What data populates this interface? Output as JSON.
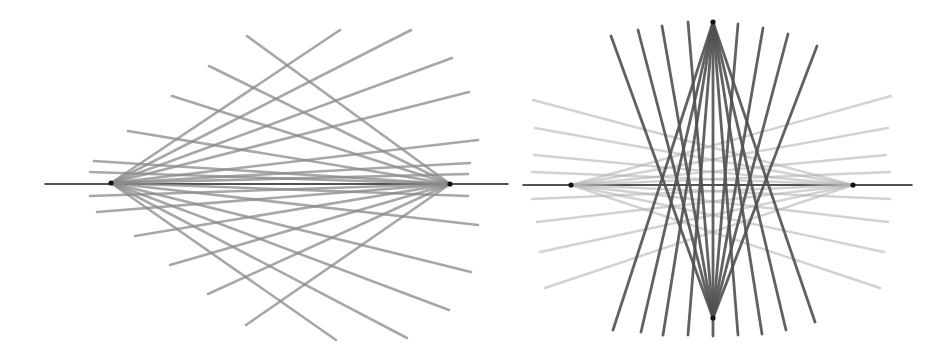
{
  "figure": {
    "title": "",
    "background_color": "#ffffff",
    "width": 948,
    "height": 352,
    "panel_count": 2,
    "panels": [
      {
        "name": "left-panel",
        "label": "",
        "axis": {
          "x1": 45,
          "y1": 184,
          "x2": 508,
          "y2": 184,
          "color": "#1c1c1c",
          "width": 1.6
        },
        "foci": [
          {
            "name": "left-focus",
            "x": 111,
            "y": 183
          },
          {
            "name": "right-focus",
            "x": 450,
            "y": 184
          }
        ]
      },
      {
        "name": "right-panel",
        "label": "",
        "axis": {
          "x1": 523,
          "y1": 185,
          "x2": 912,
          "y2": 185,
          "color": "#1c1c1c",
          "width": 1.6
        },
        "foci": [
          {
            "name": "left-focus",
            "x": 571,
            "y": 185
          },
          {
            "name": "right-focus",
            "x": 853,
            "y": 185
          },
          {
            "name": "top-vertex",
            "x": 713,
            "y": 22
          },
          {
            "name": "bottom-vertex",
            "x": 713,
            "y": 318
          }
        ]
      }
    ]
  },
  "chart_data": {
    "type": "line",
    "title": "",
    "subtitle": "",
    "xlabel": "",
    "ylabel": "",
    "xlim": [
      0,
      948
    ],
    "ylim": [
      352,
      0
    ],
    "grid": false,
    "legend": "none",
    "annotations": [],
    "series": [
      {
        "name": "left-panel-axis",
        "color": "#1c1c1c",
        "width": 1.6,
        "opacity": 1.0,
        "points": [
          [
            45,
            184
          ],
          [
            508,
            184
          ]
        ]
      },
      {
        "name": "left-panel-pencil-from-left-focus",
        "color": "#8a8a8a",
        "width": 2.6,
        "opacity": 0.75,
        "origin": [
          111,
          183
        ],
        "segments": [
          [
            [
              111,
              183
            ],
            [
              469,
              92
            ]
          ],
          [
            [
              111,
              183
            ],
            [
              452,
              58
            ]
          ],
          [
            [
              111,
              183
            ],
            [
              411,
              30
            ]
          ],
          [
            [
              111,
              183
            ],
            [
              340,
              30
            ]
          ],
          [
            [
              111,
              183
            ],
            [
              478,
              140
            ]
          ],
          [
            [
              111,
              183
            ],
            [
              470,
              163
            ]
          ],
          [
            [
              111,
              183
            ],
            [
              468,
              174
            ]
          ],
          [
            [
              111,
              183
            ],
            [
              468,
              196
            ]
          ],
          [
            [
              111,
              183
            ],
            [
              478,
              225
            ]
          ],
          [
            [
              111,
              183
            ],
            [
              471,
              272
            ]
          ],
          [
            [
              111,
              183
            ],
            [
              449,
              310
            ]
          ],
          [
            [
              111,
              183
            ],
            [
              407,
              338
            ]
          ],
          [
            [
              111,
              183
            ],
            [
              336,
              340
            ]
          ]
        ]
      },
      {
        "name": "left-panel-pencil-from-right-focus",
        "color": "#8a8a8a",
        "width": 2.6,
        "opacity": 0.75,
        "origin": [
          450,
          184
        ],
        "segments": [
          [
            [
              450,
              184
            ],
            [
              247,
              36
            ]
          ],
          [
            [
              450,
              184
            ],
            [
              209,
              66
            ]
          ],
          [
            [
              450,
              184
            ],
            [
              172,
              96
            ]
          ],
          [
            [
              450,
              184
            ],
            [
              128,
              131
            ]
          ],
          [
            [
              450,
              184
            ],
            [
              94,
              161
            ]
          ],
          [
            [
              450,
              184
            ],
            [
              90,
              172
            ]
          ],
          [
            [
              450,
              184
            ],
            [
              90,
              196
            ]
          ],
          [
            [
              450,
              184
            ],
            [
              97,
              212
            ]
          ],
          [
            [
              450,
              184
            ],
            [
              135,
              236
            ]
          ],
          [
            [
              450,
              184
            ],
            [
              170,
              265
            ]
          ],
          [
            [
              450,
              184
            ],
            [
              208,
              294
            ]
          ],
          [
            [
              450,
              184
            ],
            [
              246,
              325
            ]
          ]
        ]
      },
      {
        "name": "right-panel-axis",
        "color": "#1c1c1c",
        "width": 1.6,
        "opacity": 1.0,
        "points": [
          [
            523,
            185
          ],
          [
            912,
            185
          ]
        ]
      },
      {
        "name": "right-panel-pencil-from-left-focus",
        "color": "#b4b4b4",
        "width": 2.4,
        "opacity": 0.6,
        "origin": [
          571,
          185
        ],
        "segments": [
          [
            [
              571,
              185
            ],
            [
              891,
              96
            ]
          ],
          [
            [
              571,
              185
            ],
            [
              888,
              128
            ]
          ],
          [
            [
              571,
              185
            ],
            [
              886,
              155
            ]
          ],
          [
            [
              571,
              185
            ],
            [
              890,
              172
            ]
          ],
          [
            [
              571,
              185
            ],
            [
              890,
              199
            ]
          ],
          [
            [
              571,
              185
            ],
            [
              888,
              222
            ]
          ],
          [
            [
              571,
              185
            ],
            [
              884,
              252
            ]
          ],
          [
            [
              571,
              185
            ],
            [
              880,
              288
            ]
          ]
        ]
      },
      {
        "name": "right-panel-pencil-from-right-focus",
        "color": "#b4b4b4",
        "width": 2.4,
        "opacity": 0.6,
        "origin": [
          853,
          185
        ],
        "segments": [
          [
            [
              853,
              185
            ],
            [
              533,
              100
            ]
          ],
          [
            [
              853,
              185
            ],
            [
              535,
              128
            ]
          ],
          [
            [
              853,
              185
            ],
            [
              534,
              155
            ]
          ],
          [
            [
              853,
              185
            ],
            [
              532,
              172
            ]
          ],
          [
            [
              853,
              185
            ],
            [
              532,
              199
            ]
          ],
          [
            [
              853,
              185
            ],
            [
              537,
              222
            ]
          ],
          [
            [
              853,
              185
            ],
            [
              540,
              252
            ]
          ],
          [
            [
              853,
              185
            ],
            [
              545,
              288
            ]
          ]
        ]
      },
      {
        "name": "right-panel-pencil-from-top-vertex",
        "color": "#505050",
        "width": 2.8,
        "opacity": 0.9,
        "origin": [
          713,
          22
        ],
        "segments": [
          [
            [
              713,
              22
            ],
            [
              613,
              330
            ]
          ],
          [
            [
              713,
              22
            ],
            [
              641,
              332
            ]
          ],
          [
            [
              713,
              22
            ],
            [
              663,
              335
            ]
          ],
          [
            [
              713,
              22
            ],
            [
              688,
              335
            ]
          ],
          [
            [
              713,
              22
            ],
            [
              713,
              336
            ]
          ],
          [
            [
              713,
              22
            ],
            [
              738,
              335
            ]
          ],
          [
            [
              713,
              22
            ],
            [
              762,
              334
            ]
          ],
          [
            [
              713,
              22
            ],
            [
              786,
              330
            ]
          ],
          [
            [
              713,
              22
            ],
            [
              815,
              322
            ]
          ]
        ]
      },
      {
        "name": "right-panel-pencil-from-bottom-vertex",
        "color": "#505050",
        "width": 2.8,
        "opacity": 0.9,
        "origin": [
          713,
          318
        ],
        "segments": [
          [
            [
              713,
              318
            ],
            [
              611,
              36
            ]
          ],
          [
            [
              713,
              318
            ],
            [
              638,
              30
            ]
          ],
          [
            [
              713,
              318
            ],
            [
              662,
              26
            ]
          ],
          [
            [
              713,
              318
            ],
            [
              688,
              22
            ]
          ],
          [
            [
              713,
              318
            ],
            [
              738,
              24
            ]
          ],
          [
            [
              713,
              318
            ],
            [
              763,
              28
            ]
          ],
          [
            [
              713,
              318
            ],
            [
              788,
              34
            ]
          ],
          [
            [
              713,
              318
            ],
            [
              817,
              46
            ]
          ]
        ]
      }
    ]
  }
}
